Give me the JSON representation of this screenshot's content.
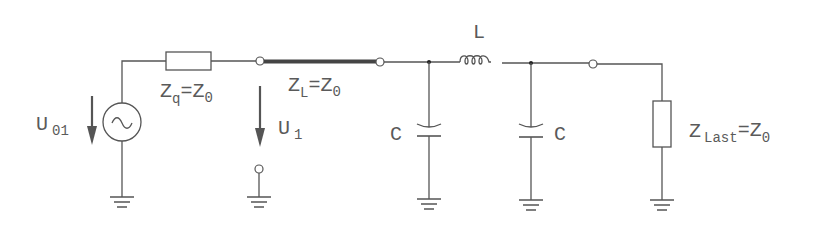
{
  "diagram": {
    "type": "circuit-schematic",
    "labels": {
      "source_voltage": {
        "main": "U",
        "sub": "01"
      },
      "source_impedance": {
        "main": "Z",
        "sub": "q",
        "rest": "=Z",
        "sub2": "0"
      },
      "line_impedance": {
        "main": "Z",
        "sub": "L",
        "rest": "=Z",
        "sub2": "0"
      },
      "port_voltage": {
        "main": "U",
        "sub": "1"
      },
      "capacitor_1": "C",
      "inductor": "L",
      "capacitor_2": "C",
      "load_impedance": {
        "main": "Z",
        "sub": "Last",
        "rest": "=Z",
        "sub2": "0"
      }
    },
    "components": [
      {
        "id": "source",
        "kind": "ac-voltage-source",
        "symbol": "~"
      },
      {
        "id": "Zq",
        "kind": "resistor"
      },
      {
        "id": "ZL",
        "kind": "transmission-line"
      },
      {
        "id": "C1",
        "kind": "capacitor"
      },
      {
        "id": "L",
        "kind": "inductor"
      },
      {
        "id": "C2",
        "kind": "capacitor"
      },
      {
        "id": "ZLast",
        "kind": "resistor"
      }
    ],
    "colors": {
      "wire": "#555555",
      "line_thick": "#444444",
      "text": "#5a5a5a"
    }
  }
}
